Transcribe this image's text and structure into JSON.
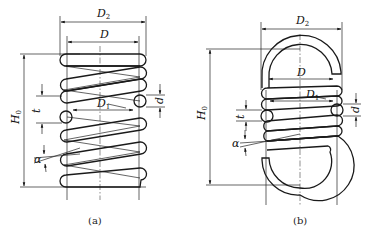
{
  "figure_a": {
    "caption": "(a)",
    "labels": {
      "D2": "D",
      "D2_sub": "2",
      "D": "D",
      "D1": "D",
      "D1_sub": "1",
      "H0": "H",
      "H0_sub": "0",
      "t": "t",
      "d": "d",
      "alpha": "α"
    }
  },
  "figure_b": {
    "caption": "(b)",
    "labels": {
      "D2": "D",
      "D2_sub": "2",
      "D": "D",
      "D1": "D",
      "D1_sub": "1",
      "H0": "H",
      "H0_sub": "0",
      "t": "t",
      "d": "d",
      "alpha": "α"
    }
  },
  "colors": {
    "line": "#1a1a1a",
    "background": "#ffffff"
  }
}
